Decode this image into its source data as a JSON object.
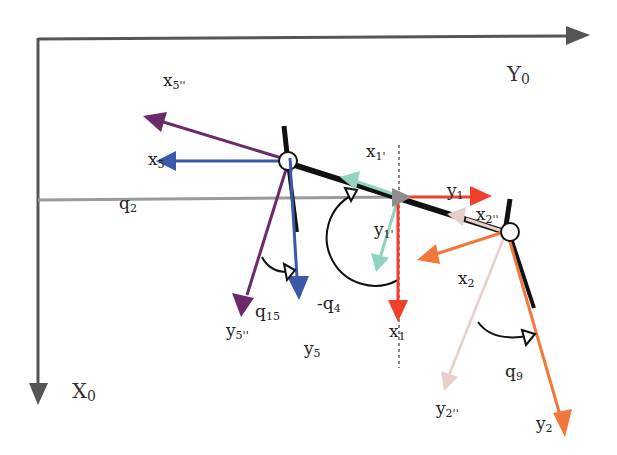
{
  "diagram": {
    "type": "kinematic-frame-diagram",
    "colors": {
      "axis": "#555555",
      "link": "#111111",
      "q2_line": "#9a9a9a",
      "frame5": "#3b59a8",
      "frame5pp": "#6b2a6a",
      "frame1": "#f0402a",
      "frame1p": "#8fd3c0",
      "frame2": "#f2773a",
      "frame2pp": "#e6cfc8",
      "rotation_arrow": "#111111",
      "dotted_line": "#666666"
    },
    "labels": {
      "Y0": {
        "base": "Y",
        "sub": "0"
      },
      "X0": {
        "base": "X",
        "sub": "0"
      },
      "x5pp": {
        "base": "x",
        "sub": "5''"
      },
      "x5": {
        "base": "x",
        "sub": "5"
      },
      "q2": {
        "base": "q",
        "sub": "2"
      },
      "x1p": {
        "base": "x",
        "sub": "1'"
      },
      "y1": {
        "base": "y",
        "sub": "1"
      },
      "x2pp": {
        "base": "x",
        "sub": "2''"
      },
      "y1p": {
        "base": "y",
        "sub": "1'"
      },
      "x2": {
        "base": "x",
        "sub": "2"
      },
      "q15": {
        "base": "q",
        "sub": "15"
      },
      "minus_q4": {
        "base": "-q",
        "sub": "4"
      },
      "x1": {
        "base": "x",
        "sub": "1"
      },
      "y5pp": {
        "base": "y",
        "sub": "5''"
      },
      "y5": {
        "base": "y",
        "sub": "5"
      },
      "q9": {
        "base": "q",
        "sub": "9"
      },
      "y2pp": {
        "base": "y",
        "sub": "2''"
      },
      "y2": {
        "base": "y",
        "sub": "2"
      }
    }
  }
}
